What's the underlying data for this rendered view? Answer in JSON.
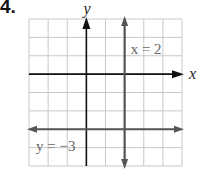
{
  "problem": {
    "number": "4."
  },
  "graph": {
    "x_axis_label": "x",
    "y_axis_label": "y",
    "grid": {
      "cols": 8,
      "rows": 8,
      "left": 29,
      "top": 19,
      "right": 182,
      "bottom": 166
    },
    "origin_col": 3,
    "origin_row": 3,
    "lines": [
      {
        "equation": "x = 2",
        "type": "vertical",
        "value": 2,
        "label": "x = 2"
      },
      {
        "equation": "y = −3",
        "type": "horizontal",
        "value": -3,
        "label": "y = −3"
      }
    ],
    "colors": {
      "grid": "#c8c8c8",
      "axis": "#111111",
      "line": "#555555",
      "label": "#666666"
    }
  }
}
